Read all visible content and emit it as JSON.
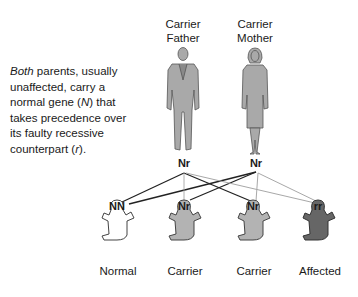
{
  "parents": {
    "father": {
      "title_line1": "Carrier",
      "title_line2": "Father",
      "genotype": "Nr"
    },
    "mother": {
      "title_line1": "Carrier",
      "title_line2": "Mother",
      "genotype": "Nr"
    }
  },
  "description": {
    "emphasis": "Both",
    "part1": " parents, usually unaffected, carry a normal gene (",
    "gene_normal": "N",
    "part2": ") that takes precedence over its faulty recessive counterpart (",
    "gene_recessive": "r",
    "part3": ")."
  },
  "children": [
    {
      "genotype": "NN",
      "label": "Normal",
      "fill": "#ffffff"
    },
    {
      "genotype": "Nr",
      "label": "Carrier",
      "fill": "#b3b3b3"
    },
    {
      "genotype": "Nr",
      "label": "Carrier",
      "fill": "#b3b3b3"
    },
    {
      "genotype": "rr",
      "label": "Affected",
      "fill": "#666666"
    }
  ],
  "colors": {
    "dark_line": "#222222",
    "light_line": "#a8a8a8",
    "figure_fill": "#a9a9a9",
    "figure_stroke": "#555555"
  }
}
